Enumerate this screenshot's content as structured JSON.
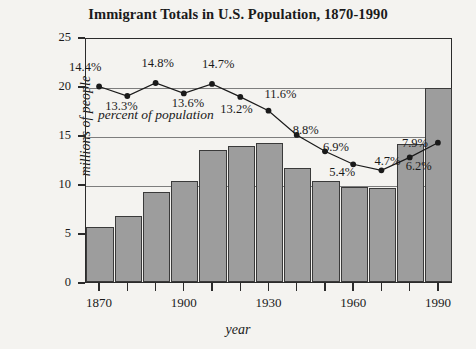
{
  "chart_data": {
    "type": "bar",
    "title": "Immigrant Totals in U.S. Population, 1870-1990",
    "xlabel": "year",
    "ylabel": "millions of people",
    "ylim": [
      0,
      25
    ],
    "yticks": [
      0,
      5,
      10,
      15,
      20,
      25
    ],
    "xlim": [
      1865,
      1995
    ],
    "xticks_labeled": [
      1870,
      1900,
      1930,
      1960,
      1990
    ],
    "xticks_all": [
      1870,
      1880,
      1890,
      1900,
      1910,
      1920,
      1930,
      1940,
      1950,
      1960,
      1970,
      1980,
      1990
    ],
    "grid": "horizontal gridlines at 10, 15, 20",
    "legend": "none",
    "categories": [
      1870,
      1880,
      1890,
      1900,
      1910,
      1920,
      1930,
      1940,
      1950,
      1960,
      1970,
      1980,
      1990
    ],
    "series": [
      {
        "name": "Immigrant totals (millions of people)",
        "type": "bar",
        "values": [
          5.6,
          6.7,
          9.2,
          10.3,
          13.5,
          13.9,
          14.2,
          11.6,
          10.3,
          9.7,
          9.6,
          14.1,
          19.8
        ]
      },
      {
        "name": "percent of population",
        "type": "line",
        "axis": "secondary (annotated values only)",
        "values": [
          14.4,
          13.3,
          14.8,
          13.6,
          14.7,
          13.2,
          11.6,
          8.8,
          6.9,
          5.4,
          4.7,
          6.2,
          7.9
        ],
        "labels": [
          "14.4%",
          "13.3%",
          "14.8%",
          "13.6%",
          "14.7%",
          "13.2%",
          "11.6%",
          "8.8%",
          "6.9%",
          "5.4%",
          "4.7%",
          "6.2%",
          "7.9%"
        ],
        "annotation": "percent of population"
      }
    ]
  },
  "colors": {
    "background": "#f4f3f0",
    "bar_fill": "#9d9d9d",
    "bar_stroke": "#3a3a3a",
    "axis": "#2b2b2b",
    "gridline": "#7d7d7d",
    "line_series": "#1a1a1a",
    "text": "#1a1a1a"
  }
}
